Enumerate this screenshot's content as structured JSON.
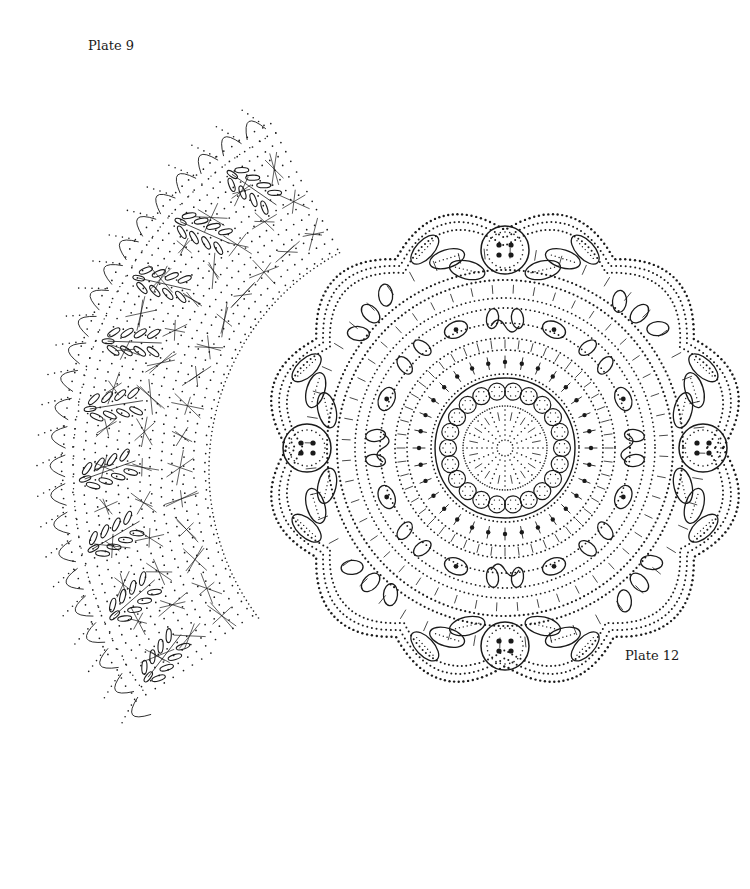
{
  "page": {
    "background": "#ffffff",
    "ink": "#1a1a1a"
  },
  "plates": [
    {
      "id": "plate-9",
      "label": "Plate 9",
      "kind": "curved edging pricking",
      "motif": "leaf sprays with torchon ground",
      "arc": {
        "cx": 455,
        "cy": 470,
        "r_outer": 420,
        "r_inner": 250,
        "start_deg": 217,
        "end_deg": 118,
        "sprays": 9
      }
    },
    {
      "id": "plate-12",
      "label": "Plate 12",
      "kind": "round doily pricking",
      "motif": "four flowers with leaves, scalloped edge, central ring of beads",
      "circle": {
        "cx": 505,
        "cy": 448,
        "scallop_r": 240,
        "flowers": 4,
        "center_beads": 22
      }
    }
  ]
}
